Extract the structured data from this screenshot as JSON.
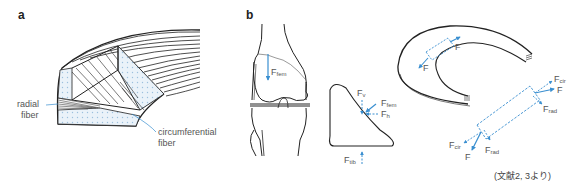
{
  "figure": {
    "panels": [
      {
        "id": "a",
        "label": "a",
        "annotations": {
          "radial": "radial\nfiber",
          "radial_line1": "radial",
          "radial_line2": "fiber",
          "circ_line1": "circumferential",
          "circ_line2": "fiber"
        }
      },
      {
        "id": "b",
        "label": "b",
        "forces": {
          "femoral": {
            "main": "F",
            "sub": "fem"
          },
          "vertical": {
            "main": "F",
            "sub": "v"
          },
          "wedge_fem": {
            "main": "F",
            "sub": "fem"
          },
          "horizontal": {
            "main": "F",
            "sub": "h"
          },
          "tibial": {
            "main": "F",
            "sub": "tib"
          },
          "meniscus_f1": {
            "main": "F",
            "sub": ""
          },
          "meniscus_f2": {
            "main": "F",
            "sub": ""
          },
          "cir_top": {
            "main": "F",
            "sub": "cir"
          },
          "f_top": {
            "main": "F",
            "sub": ""
          },
          "rad_top": {
            "main": "F",
            "sub": "rad"
          },
          "cir_bottom": {
            "main": "F",
            "sub": "cir"
          },
          "f_bottom": {
            "main": "F",
            "sub": ""
          },
          "rad_bottom": {
            "main": "F",
            "sub": "rad"
          }
        }
      }
    ],
    "citation": "(文献2, 3より)",
    "colors": {
      "force_arrow": "#3a8fd0",
      "outline": "#222222",
      "dot_fill": "#dbe9f4",
      "label_text": "#555555"
    }
  }
}
